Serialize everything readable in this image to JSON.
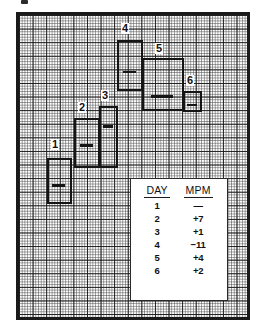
{
  "figure": {
    "top_mark": "",
    "background": "#ffffff",
    "ink_color": "#151515",
    "grid_color": "#464646"
  },
  "chart_data": {
    "type": "bar",
    "title": "",
    "subtitle": "",
    "xlabel": "",
    "ylabel": "",
    "grid": true,
    "legend": "none",
    "categories": [
      "1",
      "2",
      "3",
      "4",
      "5",
      "6"
    ],
    "series": [
      {
        "name": "MPM change",
        "values": [
          null,
          7,
          1,
          -11,
          4,
          2
        ]
      }
    ],
    "bars": [
      {
        "label": "1",
        "mpm": "—",
        "x": 44,
        "y": 155,
        "width": 25,
        "height": 46,
        "tick_y": 0.52,
        "label_x": 48,
        "label_y": 136
      },
      {
        "label": "2",
        "mpm": "+7",
        "x": 71,
        "y": 115,
        "width": 26,
        "height": 50,
        "tick_y": 0.48,
        "label_x": 75,
        "label_y": 99
      },
      {
        "label": "3",
        "mpm": "+1",
        "x": 96,
        "y": 103,
        "width": 19,
        "height": 62,
        "tick_y": 0.28,
        "label_x": 98,
        "label_y": 87
      },
      {
        "label": "4",
        "mpm": "−11",
        "x": 114,
        "y": 37,
        "width": 26,
        "height": 51,
        "tick_y": 0.56,
        "label_x": 118,
        "label_y": 20
      },
      {
        "label": "5",
        "mpm": "+4",
        "x": 139,
        "y": 55,
        "width": 42,
        "height": 53,
        "tick_y": 0.66,
        "label_x": 152,
        "label_y": 40
      },
      {
        "label": "6",
        "mpm": "+2",
        "x": 180,
        "y": 88,
        "width": 19,
        "height": 21,
        "tick_y": 0.5,
        "label_x": 183,
        "label_y": 72
      }
    ]
  },
  "table": {
    "headers": [
      "DAY",
      "MPM"
    ],
    "rows": [
      {
        "day": "1",
        "mpm": "—"
      },
      {
        "day": "2",
        "mpm": "+7"
      },
      {
        "day": "3",
        "mpm": "+1"
      },
      {
        "day": "4",
        "mpm": "−11"
      },
      {
        "day": "5",
        "mpm": "+4"
      },
      {
        "day": "6",
        "mpm": "+2"
      }
    ]
  }
}
